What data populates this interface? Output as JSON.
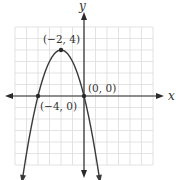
{
  "chart_data": {
    "type": "line",
    "title": "",
    "xlabel": "x",
    "ylabel": "y",
    "function": "y = -x^2 - 4x",
    "xlim": [
      -6,
      6
    ],
    "ylim": [
      -6,
      6
    ],
    "grid": true,
    "series": [
      {
        "name": "parabola",
        "x": [
          -5.4,
          -5,
          -4,
          -3,
          -2,
          -1,
          0,
          1,
          1.4
        ],
        "y": [
          -5.56,
          -5,
          0,
          3,
          4,
          3,
          0,
          -5,
          -7.56
        ]
      }
    ],
    "points": [
      {
        "x": -2,
        "y": 4,
        "label": "(−2, 4)"
      },
      {
        "x": -4,
        "y": 0,
        "label": "(−4, 0)"
      },
      {
        "x": 0,
        "y": 0,
        "label": "(0, 0)"
      }
    ],
    "annotations": [
      "(−2, 4)",
      "(−4, 0)",
      "(0, 0)"
    ]
  },
  "labels": {
    "x_axis": "x",
    "y_axis": "y",
    "vertex": "(−2, 4)",
    "left_intercept": "(−4, 0)",
    "origin": "(0, 0)"
  },
  "colors": {
    "grid": "#d8d8d8",
    "axis": "#2a2a2a",
    "curve": "#3a3a3a",
    "text": "#333333"
  }
}
